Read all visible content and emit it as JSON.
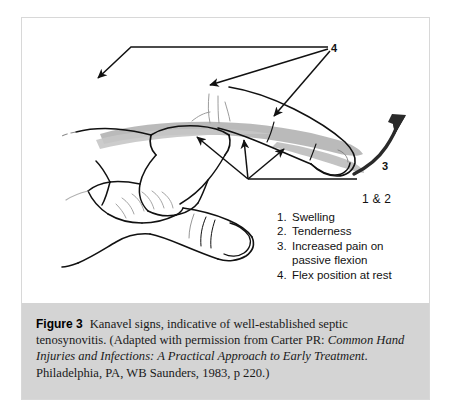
{
  "figure": {
    "number_label": "Figure 3",
    "caption_part1": "Kanavel signs, indicative of well-established septic tenosynovitis. (Adapted with permission from Carter PR: ",
    "caption_italic": "Common Hand Injuries and Infections: A Practical Approach to Early Treatment",
    "caption_part2": ". Philadelphia, PA, WB Saunders, 1983, p 220.)"
  },
  "callouts": {
    "four": "4",
    "three": "3",
    "one_and_two": "1 & 2"
  },
  "signs": {
    "items": [
      {
        "num": "1.",
        "text": "Swelling",
        "cont": ""
      },
      {
        "num": "2.",
        "text": "Tenderness",
        "cont": ""
      },
      {
        "num": "3.",
        "text": "Increased pain on",
        "cont": "passive flexion"
      },
      {
        "num": "4.",
        "text": "Flex position at rest",
        "cont": ""
      }
    ]
  },
  "illustration": {
    "alt_name": "hand-with-septic-tenosynovitis-line-drawing",
    "ink_color": "#111111",
    "swelling_shade_color": "#b6b6b6",
    "caption_band_color": "#d4d4d4",
    "frame_border_color": "#d8d8d8"
  }
}
